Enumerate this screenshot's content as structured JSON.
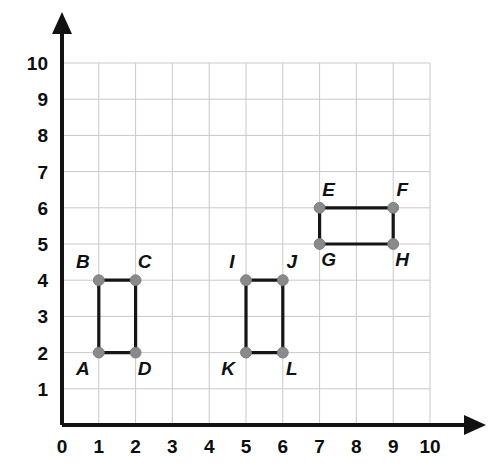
{
  "figure": {
    "kind": "coordinate-grid-figure",
    "background_color": "#ffffff",
    "grid_color": "#c9c9c9",
    "axis_color": "#121212",
    "edge_color": "#151515",
    "vertex_color": "#8a8a8a",
    "label_color": "#111111"
  },
  "chart_data": {
    "type": "scatter",
    "title": "",
    "xlabel": "",
    "ylabel": "",
    "xlim": [
      0,
      10
    ],
    "ylim": [
      0,
      10
    ],
    "grid": true,
    "legend": "none",
    "x_ticks": [
      "0",
      "1",
      "2",
      "3",
      "4",
      "5",
      "6",
      "7",
      "8",
      "9",
      "10"
    ],
    "y_ticks": [
      "1",
      "2",
      "3",
      "4",
      "5",
      "6",
      "7",
      "8",
      "9",
      "10"
    ],
    "x_tick_values": [
      0,
      1,
      2,
      3,
      4,
      5,
      6,
      7,
      8,
      9,
      10
    ],
    "y_tick_values": [
      1,
      2,
      3,
      4,
      5,
      6,
      7,
      8,
      9,
      10
    ],
    "points": [
      {
        "label": "A",
        "x": 1,
        "y": 2,
        "label_dx": -16,
        "label_dy": 22
      },
      {
        "label": "B",
        "x": 1,
        "y": 4,
        "label_dx": -16,
        "label_dy": -12
      },
      {
        "label": "C",
        "x": 2,
        "y": 4,
        "label_dx": 9,
        "label_dy": -12
      },
      {
        "label": "D",
        "x": 2,
        "y": 2,
        "label_dx": 9,
        "label_dy": 22
      },
      {
        "label": "E",
        "x": 7,
        "y": 6,
        "label_dx": 9,
        "label_dy": -12
      },
      {
        "label": "F",
        "x": 9,
        "y": 6,
        "label_dx": 9,
        "label_dy": -12
      },
      {
        "label": "G",
        "x": 7,
        "y": 5,
        "label_dx": 9,
        "label_dy": 22
      },
      {
        "label": "H",
        "x": 9,
        "y": 5,
        "label_dx": 9,
        "label_dy": 22
      },
      {
        "label": "I",
        "x": 5,
        "y": 4,
        "label_dx": -14,
        "label_dy": -12
      },
      {
        "label": "J",
        "x": 6,
        "y": 4,
        "label_dx": 9,
        "label_dy": -12
      },
      {
        "label": "K",
        "x": 5,
        "y": 2,
        "label_dx": -18,
        "label_dy": 22
      },
      {
        "label": "L",
        "x": 6,
        "y": 2,
        "label_dx": 9,
        "label_dy": 22
      }
    ],
    "shapes": [
      {
        "name": "rectangle-ABCD",
        "vertices": [
          "A",
          "B",
          "C",
          "D"
        ]
      },
      {
        "name": "rectangle-EFGH",
        "vertices": [
          "G",
          "E",
          "F",
          "H"
        ]
      },
      {
        "name": "rectangle-IJKL",
        "vertices": [
          "K",
          "I",
          "J",
          "L"
        ]
      }
    ]
  }
}
